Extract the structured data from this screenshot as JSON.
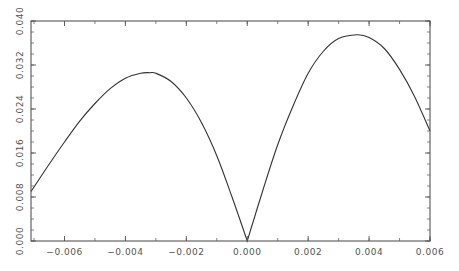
{
  "chart_data": {
    "type": "line",
    "title": "",
    "xlabel": "",
    "ylabel": "",
    "xlim": [
      -0.0071,
      0.006
    ],
    "ylim": [
      0.0,
      0.04
    ],
    "grid": false,
    "legend": null,
    "x_ticks": [
      "-0.006",
      "-0.004",
      "-0.002",
      "0.000",
      "0.002",
      "0.004",
      "0.006"
    ],
    "x_tick_values": [
      -0.006,
      -0.004,
      -0.002,
      0.0,
      0.002,
      0.004,
      0.006
    ],
    "x_minor_step": 0.001,
    "y_ticks": [
      "0.000",
      "0.008",
      "0.016",
      "0.024",
      "0.032",
      "0.040"
    ],
    "y_tick_values": [
      0.0,
      0.008,
      0.016,
      0.024,
      0.032,
      0.04
    ],
    "y_minor_step": 0.002,
    "series": [
      {
        "name": "curve",
        "color": "#333333",
        "x": [
          -0.0071,
          -0.0065,
          -0.006,
          -0.0055,
          -0.005,
          -0.0045,
          -0.004,
          -0.0035,
          -0.0032,
          -0.003,
          -0.0025,
          -0.002,
          -0.0015,
          -0.001,
          -0.0005,
          0.0,
          0.0005,
          0.001,
          0.0015,
          0.002,
          0.0025,
          0.003,
          0.0036,
          0.004,
          0.0045,
          0.005,
          0.0055,
          0.006
        ],
        "y": [
          0.009,
          0.014,
          0.018,
          0.0218,
          0.025,
          0.0277,
          0.0296,
          0.0305,
          0.0306,
          0.0305,
          0.029,
          0.026,
          0.0215,
          0.0155,
          0.008,
          0.0,
          0.009,
          0.0175,
          0.0245,
          0.0305,
          0.0345,
          0.0368,
          0.0375,
          0.037,
          0.035,
          0.0312,
          0.0262,
          0.02
        ]
      }
    ]
  }
}
